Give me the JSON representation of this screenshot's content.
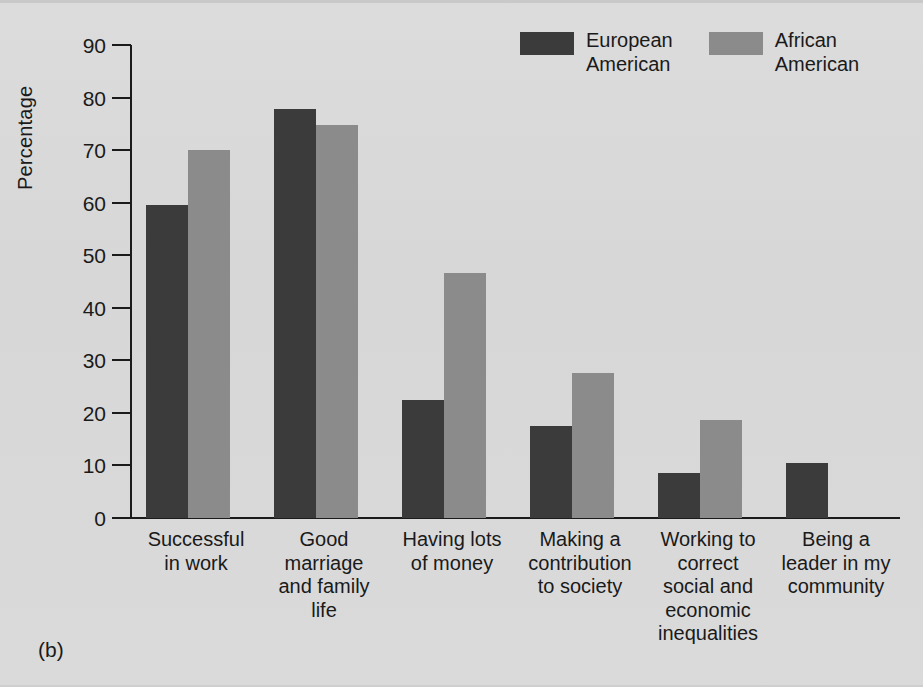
{
  "figure": {
    "panel_label": "(b)",
    "background_color": "#d9d9d9"
  },
  "legend": {
    "position": "top-right",
    "items": [
      {
        "label": "European\nAmerican",
        "color": "#3b3b3b",
        "key": "european_american"
      },
      {
        "label": "African\nAmerican",
        "color": "#8b8b8b",
        "key": "african_american"
      }
    ]
  },
  "axes": {
    "y_label": "Percentage",
    "y_ticks": [
      "90",
      "80",
      "70",
      "60",
      "50",
      "40",
      "30",
      "20",
      "10",
      "0"
    ],
    "y_min": 0,
    "y_max": 90,
    "x_labels": [
      "Successful\nin work",
      "Good\nmarriage\nand family\nlife",
      "Having lots\nof money",
      "Making a\ncontribution\nto society",
      "Working to\ncorrect\nsocial and\neconomic\ninequalities",
      "Being a\nleader in my\ncommunity"
    ]
  },
  "chart_data": {
    "type": "bar",
    "title": "",
    "xlabel": "",
    "ylabel": "Percentage",
    "ylim": [
      0,
      90
    ],
    "grid": false,
    "legend_position": "top-right",
    "categories": [
      "Successful in work",
      "Good marriage and family life",
      "Having lots of money",
      "Making a contribution to society",
      "Working to correct social and economic inequalities",
      "Being a leader in my community"
    ],
    "series": [
      {
        "name": "European American",
        "color": "#3b3b3b",
        "values": [
          59.5,
          77.8,
          22.5,
          17.5,
          8.5,
          10.5
        ]
      },
      {
        "name": "African American",
        "color": "#8b8b8b",
        "values": [
          70,
          74.8,
          46.7,
          27.6,
          18.6,
          null
        ]
      }
    ]
  }
}
